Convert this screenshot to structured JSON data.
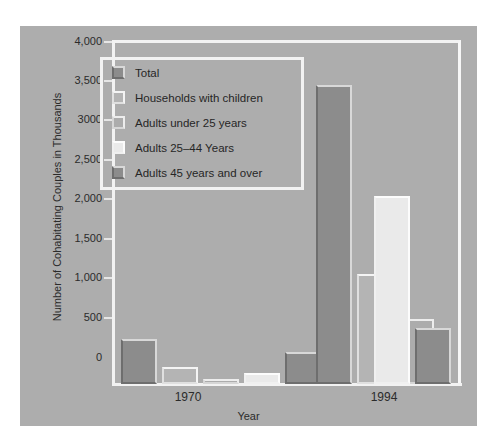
{
  "chart_data": {
    "type": "bar",
    "title": "",
    "xlabel": "Year",
    "ylabel": "Number of Cohabitating Couples in Thousands",
    "categories": [
      "1970",
      "1994"
    ],
    "ylim": [
      0,
      4000
    ],
    "ytick_labels": [
      "4,000",
      "3,500",
      "3000",
      "2,500",
      "2,000",
      "1,500",
      "1,000",
      "500",
      "0"
    ],
    "ytick_values": [
      4000,
      3500,
      3000,
      2500,
      2000,
      1500,
      1000,
      500,
      0
    ],
    "grid": false,
    "legend_position": "upper-left-inside",
    "series": [
      {
        "name": "Total",
        "values": [
          530,
          3510
        ],
        "color": "#8c8c8c"
      },
      {
        "name": "Households with children",
        "values": [
          200,
          1290
        ],
        "color": "#b4b4b4"
      },
      {
        "name": "Adults under 25 years",
        "values": [
          55,
          760
        ],
        "color": "#acacac"
      },
      {
        "name": "Adults 25–44 Years",
        "values": [
          130,
          2200
        ],
        "color": "#eaeaea"
      },
      {
        "name": "Adults 45 years and over",
        "values": [
          375,
          660
        ],
        "color": "#8c8c8c"
      }
    ]
  },
  "legend": {
    "items": [
      {
        "label": "Total",
        "swatch": "legend-swatch-total"
      },
      {
        "label": "Households with children",
        "swatch": "legend-swatch-children"
      },
      {
        "label": "Adults under 25 years",
        "swatch": "legend-swatch-under-25"
      },
      {
        "label": "Adults 25–44 Years",
        "swatch": "legend-swatch-25-44"
      },
      {
        "label": "Adults 45 years and over",
        "swatch": "legend-swatch-45-plus"
      }
    ]
  },
  "axes": {
    "y_title": "Number of Cohabitating Couples in Thousands",
    "x_title": "Year",
    "y_ticks": [
      "4,000",
      "3,500",
      "3000",
      "2,500",
      "2,000",
      "1,500",
      "1,000",
      "500",
      "0"
    ],
    "x_groups": [
      "1970",
      "1994"
    ]
  },
  "colors": {
    "figure_background": "#adadad",
    "page_background": "#ffffff",
    "frame": "#f2f2f2",
    "text": "#2b2b2b"
  }
}
